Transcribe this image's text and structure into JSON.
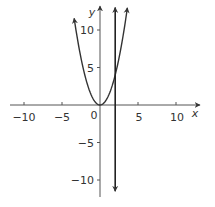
{
  "chart_data": {
    "type": "line",
    "title": "",
    "xlabel": "x",
    "ylabel": "y",
    "xlim": [
      -12,
      13
    ],
    "ylim": [
      -12,
      13
    ],
    "grid": false,
    "legend": "none",
    "x_ticks": [
      -10,
      -5,
      5,
      10
    ],
    "x_tick_labels": [
      "−10",
      "−5",
      "5",
      "10"
    ],
    "y_ticks": [
      10,
      5,
      -5,
      -10
    ],
    "y_tick_labels": [
      "10",
      "5",
      "−5",
      "−10"
    ],
    "origin_label": "0",
    "series": [
      {
        "name": "y = x^2",
        "kind": "parabola",
        "x": [
          -3.4,
          -3,
          -2,
          -1,
          0,
          1,
          2,
          3,
          3.6
        ],
        "y": [
          11.56,
          9,
          4,
          1,
          0,
          1,
          4,
          9,
          12.96
        ],
        "arrows": "both-ends"
      },
      {
        "name": "x = 2",
        "kind": "vertical-line",
        "x": [
          2,
          2
        ],
        "y": [
          -11.5,
          13
        ],
        "arrows": "both-ends"
      }
    ],
    "annotations": []
  },
  "colors": {
    "axis": "#444444",
    "curve": "#333333",
    "text": "#333333",
    "background": "#ffffff"
  }
}
